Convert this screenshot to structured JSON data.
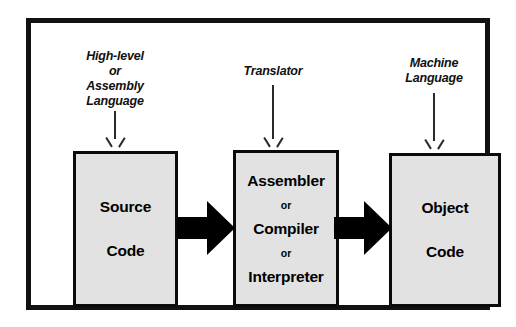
{
  "diagram": {
    "frame_color": "#111111",
    "box_fill_color": "#e2e2e2",
    "box_border_color": "#0a0a0a",
    "arrow_color": "#000000",
    "captions": [
      {
        "name": "source-language-caption",
        "text": "High-level\nor\nAssembly\nLanguage"
      },
      {
        "name": "translator-caption",
        "text": "Translator"
      },
      {
        "name": "machine-language-caption",
        "text": "Machine\nLanguage"
      }
    ],
    "boxes": [
      {
        "name": "source-code-box",
        "lines": [
          "Source",
          "Code"
        ]
      },
      {
        "name": "translator-box",
        "lines": [
          "Assembler",
          "or",
          "Compiler",
          "or",
          "Interpreter"
        ]
      },
      {
        "name": "object-code-box",
        "lines": [
          "Object",
          "Code"
        ]
      }
    ],
    "flow_arrows": [
      {
        "name": "flow-arrow-source-to-translator",
        "direction": "right"
      },
      {
        "name": "flow-arrow-translator-to-object",
        "direction": "right"
      }
    ],
    "caption_arrows": [
      {
        "name": "caption-arrow-source",
        "direction": "down"
      },
      {
        "name": "caption-arrow-translator",
        "direction": "down"
      },
      {
        "name": "caption-arrow-machine",
        "direction": "down"
      }
    ]
  }
}
